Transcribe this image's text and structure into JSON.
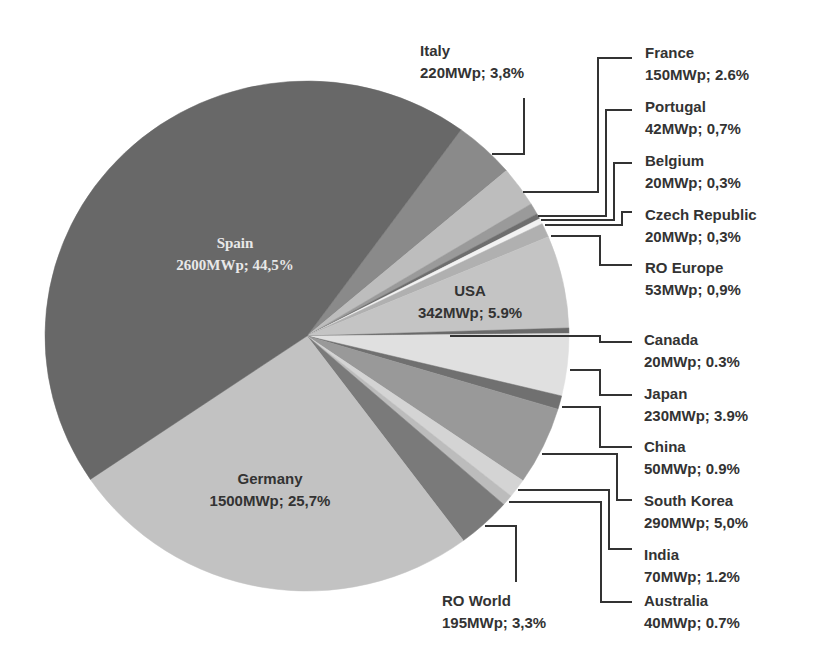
{
  "chart_data": {
    "type": "pie",
    "title": "",
    "unit": "MWp",
    "start_angle_deg": -54,
    "direction": "clockwise",
    "center": [
      307,
      336
    ],
    "radius": [
      262,
      255
    ],
    "slices": [
      {
        "name": "Italy",
        "value": 220,
        "percent": "3,8%",
        "label": "220MWp; 3,8%",
        "color": "#8a8a8a"
      },
      {
        "name": "France",
        "value": 150,
        "percent": "2.6%",
        "label": "150MWp; 2.6%",
        "color": "#bdbdbd"
      },
      {
        "name": "Portugal",
        "value": 42,
        "percent": "0,7%",
        "label": "42MWp; 0,7%",
        "color": "#9a9a9a"
      },
      {
        "name": "Belgium",
        "value": 20,
        "percent": "0,3%",
        "label": "20MWp; 0,3%",
        "color": "#6e6e6e"
      },
      {
        "name": "Czech Republic",
        "value": 20,
        "percent": "0,3%",
        "label": "20MWp; 0,3%",
        "color": "#f2f2f2"
      },
      {
        "name": "RO Europe",
        "value": 53,
        "percent": "0,9%",
        "label": "53MWp; 0,9%",
        "color": "#b0b0b0"
      },
      {
        "name": "USA",
        "value": 342,
        "percent": "5.9%",
        "label": "342MWp; 5.9%",
        "color": "#c4c4c4"
      },
      {
        "name": "Canada",
        "value": 20,
        "percent": "0.3%",
        "label": "20MWp; 0.3%",
        "color": "#6a6a6a"
      },
      {
        "name": "Japan",
        "value": 230,
        "percent": "3.9%",
        "label": "230MWp; 3.9%",
        "color": "#e0e0e0"
      },
      {
        "name": "China",
        "value": 50,
        "percent": "0.9%",
        "label": "50MWp; 0.9%",
        "color": "#707070"
      },
      {
        "name": "South Korea",
        "value": 290,
        "percent": "5,0%",
        "label": "290MWp; 5,0%",
        "color": "#999999"
      },
      {
        "name": "India",
        "value": 70,
        "percent": "1.2%",
        "label": "70MWp; 1.2%",
        "color": "#d4d4d4"
      },
      {
        "name": "Australia",
        "value": 40,
        "percent": "0.7%",
        "label": "40MWp; 0.7%",
        "color": "#bcbcbc"
      },
      {
        "name": "RO World",
        "value": 195,
        "percent": "3,3%",
        "label": "195MWp; 3,3%",
        "color": "#7a7a7a"
      },
      {
        "name": "Germany",
        "value": 1500,
        "percent": "25,7%",
        "label": "1500MWp; 25,7%",
        "color": "#c2c2c2"
      },
      {
        "name": "Spain",
        "value": 2600,
        "percent": "44,5%",
        "label": "2600MWp; 44,5%",
        "color": "#686868"
      }
    ],
    "total_mwp": 5852,
    "legend": "none (leader-line data labels)"
  },
  "labels": {
    "spain": {
      "name": "Spain",
      "value": "2600MWp; 44,5%"
    },
    "germany": {
      "name": "Germany",
      "value": "1500MWp; 25,7%"
    },
    "usa": {
      "name": "USA",
      "value": "342MWp; 5.9%"
    },
    "italy": {
      "name": "Italy",
      "value": "220MWp; 3,8%"
    },
    "france": {
      "name": "France",
      "value": "150MWp; 2.6%"
    },
    "portugal": {
      "name": "Portugal",
      "value": "42MWp; 0,7%"
    },
    "belgium": {
      "name": "Belgium",
      "value": "20MWp; 0,3%"
    },
    "czech": {
      "name": "Czech Republic",
      "value": "20MWp; 0,3%"
    },
    "ro_europe": {
      "name": "RO Europe",
      "value": "53MWp; 0,9%"
    },
    "canada": {
      "name": "Canada",
      "value": "20MWp; 0.3%"
    },
    "japan": {
      "name": "Japan",
      "value": "230MWp; 3.9%"
    },
    "china": {
      "name": "China",
      "value": "50MWp; 0.9%"
    },
    "south_korea": {
      "name": "South Korea",
      "value": "290MWp; 5,0%"
    },
    "india": {
      "name": "India",
      "value": "70MWp; 1.2%"
    },
    "australia": {
      "name": "Australia",
      "value": "40MWp; 0.7%"
    },
    "ro_world": {
      "name": "RO World",
      "value": "195MWp; 3,3%"
    }
  },
  "colors": {
    "leader_line": "#333333",
    "label_text": "#333333",
    "inner_light_text": "#e8e8e8"
  }
}
